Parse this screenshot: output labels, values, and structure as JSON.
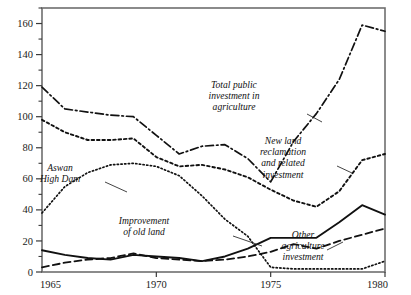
{
  "chart_data": {
    "type": "line",
    "title": "",
    "xlabel": "",
    "ylabel": "",
    "xlim": [
      1965,
      1980
    ],
    "ylim": [
      0,
      170
    ],
    "grid": false,
    "legend": "inline-annotations",
    "x": [
      1965,
      1966,
      1967,
      1968,
      1969,
      1970,
      1971,
      1972,
      1973,
      1974,
      1975,
      1976,
      1977,
      1978,
      1979,
      1980
    ],
    "xticks": [
      1965,
      1970,
      1975,
      1980
    ],
    "xtick_labels": [
      "1965",
      "1970",
      "1975",
      "1980"
    ],
    "yticks": [
      0,
      20,
      40,
      60,
      80,
      100,
      120,
      140,
      160
    ],
    "ytick_labels": [
      "0",
      "20",
      "40",
      "60",
      "80",
      "100",
      "120",
      "140",
      "160"
    ],
    "yminor_ticks": [
      10,
      30,
      50,
      70,
      90,
      110,
      130,
      150,
      170
    ],
    "series": [
      {
        "name": "Total public investment in agriculture",
        "style": "dash-dot",
        "color": "#111111",
        "values": [
          119,
          105,
          103,
          101,
          100,
          88,
          76,
          81,
          82,
          73,
          58,
          84,
          102,
          124,
          159,
          155
        ]
      },
      {
        "name": "New land reclamation and related investment",
        "style": "dotted-coarse",
        "color": "#111111",
        "values": [
          98,
          90,
          85,
          85,
          86,
          74,
          68,
          69,
          66,
          61,
          53,
          46,
          42,
          52,
          72,
          76
        ]
      },
      {
        "name": "Aswan High Dam",
        "style": "dotted-fine",
        "color": "#111111",
        "values": [
          38,
          55,
          64,
          69,
          70,
          68,
          62,
          49,
          34,
          23,
          3,
          2,
          2,
          2,
          2,
          7
        ]
      },
      {
        "name": "Improvement of old land",
        "style": "solid",
        "color": "#111111",
        "values": [
          14,
          11,
          9,
          8,
          11,
          10,
          9,
          7,
          10,
          15,
          22,
          22,
          22,
          32,
          43,
          37
        ]
      },
      {
        "name": "Other agriculture investment",
        "style": "dashed",
        "color": "#111111",
        "values": [
          3,
          6,
          8,
          9,
          12,
          9,
          8,
          7,
          8,
          10,
          13,
          18,
          15,
          20,
          24,
          28
        ]
      }
    ],
    "annotations": [
      {
        "id": "aswan-high-dam",
        "lines": [
          "Aswan",
          "High Dam"
        ],
        "text_x": 60,
        "text_y": 171,
        "leader": [
          [
            105,
            182
          ],
          [
            127,
            192
          ]
        ]
      },
      {
        "id": "improvement-of-old-land",
        "lines": [
          "Improvement",
          "of old land"
        ],
        "text_x": 144,
        "text_y": 224,
        "leader": [
          [
            233,
            236
          ],
          [
            262,
            246
          ]
        ]
      },
      {
        "id": "total-public-investment",
        "lines": [
          "Total public",
          "investment in",
          "agriculture"
        ],
        "text_x": 234,
        "text_y": 88,
        "leader": [
          [
            307,
            114
          ],
          [
            322,
            122
          ]
        ]
      },
      {
        "id": "new-land-reclamation",
        "lines": [
          "New land",
          "reclamation",
          "and related",
          "investment"
        ],
        "text_x": 283,
        "text_y": 144,
        "leader": [
          [
            337,
            166
          ],
          [
            352,
            173
          ]
        ]
      },
      {
        "id": "other-agriculture-investment",
        "lines": [
          "Other",
          "agriculture",
          "investment"
        ],
        "text_x": 303,
        "text_y": 238,
        "leader": [
          [
            327,
            250
          ],
          [
            343,
            242
          ]
        ]
      }
    ]
  }
}
